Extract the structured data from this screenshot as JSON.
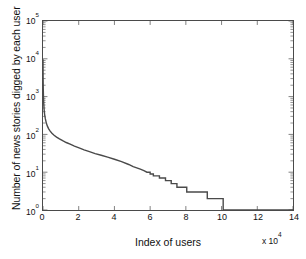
{
  "chart_data": {
    "type": "line",
    "title": "",
    "subtitle": "",
    "xlabel": "Index of users",
    "ylabel": "Number of news stories digged by each user",
    "x_multiplier": "x 10",
    "x_multiplier_exp": "4",
    "xscale": "linear",
    "yscale": "log",
    "xlim": [
      0,
      140000
    ],
    "ylim": [
      1,
      100000
    ],
    "grid": false,
    "legend": null,
    "legend_position": "none",
    "line_color": "#4a4a4a",
    "line_width": 1.4,
    "xticks": [
      "0",
      "2",
      "4",
      "6",
      "8",
      "10",
      "12",
      "14"
    ],
    "xtick_values": [
      0,
      20000,
      40000,
      60000,
      80000,
      100000,
      120000,
      140000
    ],
    "yticks": [
      {
        "mantissa": "10",
        "exponent": "0",
        "value": 1
      },
      {
        "mantissa": "10",
        "exponent": "1",
        "value": 10
      },
      {
        "mantissa": "10",
        "exponent": "2",
        "value": 100
      },
      {
        "mantissa": "10",
        "exponent": "3",
        "value": 1000
      },
      {
        "mantissa": "10",
        "exponent": "4",
        "value": 10000
      },
      {
        "mantissa": "10",
        "exponent": "5",
        "value": 100000
      }
    ],
    "series": [
      {
        "name": "stories digged per user (rank ordered)",
        "x": [
          0,
          30,
          80,
          150,
          260,
          400,
          600,
          900,
          1300,
          1800,
          2400,
          3100,
          4000,
          5000,
          6200,
          7600,
          9200,
          11000,
          13000,
          15200,
          17600,
          20200,
          23000,
          26000,
          29200,
          32600,
          36200,
          40000,
          44000,
          48000,
          50500,
          52500,
          54500,
          56500,
          58200,
          60000,
          61800,
          63500,
          65200,
          67000,
          68600,
          70200,
          71800,
          73400,
          75000,
          78000,
          80500,
          83000,
          84000,
          92000,
          100800,
          100900,
          140000
        ],
        "y": [
          9800,
          5200,
          2800,
          1600,
          1000,
          680,
          470,
          340,
          260,
          205,
          168,
          142,
          122,
          107,
          95,
          85,
          76,
          68,
          61,
          55,
          49,
          44,
          39,
          35,
          31,
          28,
          25,
          22,
          19,
          16,
          14,
          13,
          12,
          11,
          10,
          9,
          8,
          8,
          7,
          7,
          6,
          6,
          5,
          5,
          4,
          4,
          3,
          3,
          3,
          2,
          2,
          1,
          1
        ]
      }
    ]
  }
}
